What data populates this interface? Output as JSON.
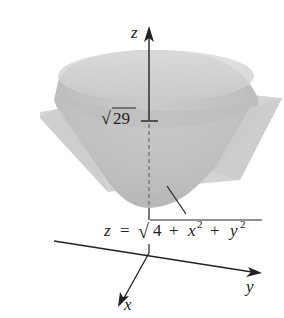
{
  "figure": {
    "axes": {
      "z_label": "z",
      "x_label": "x",
      "y_label": "y"
    },
    "plane_level_label": {
      "radical": "√",
      "value": "29"
    },
    "surface_equation": {
      "lhs": "z",
      "equals": "=",
      "radical": "√",
      "term_const": "4",
      "plus1": "+",
      "x_var": "x",
      "x_exp": "2",
      "plus2": "+",
      "y_var": "y",
      "y_exp": "2"
    },
    "colors": {
      "surface_light": "#d9d9d9",
      "surface_mid": "#c4c4c4",
      "surface_dark": "#b3b3b3",
      "plane": "#cfcfcf",
      "axis": "#222222"
    }
  }
}
